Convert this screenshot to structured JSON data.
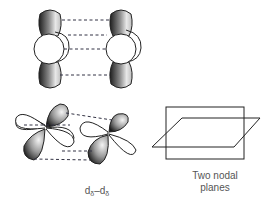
{
  "figure": {
    "top_panel": {
      "description": "Two dz2-like orbitals overlapping face to face",
      "dashed_connectors": 4
    },
    "bottom_left_panel": {
      "description": "Two four-lobed d orbitals (delta overlap)",
      "label_main": "d",
      "label_sub": "δ",
      "label_dash": "–",
      "label_main2": "d",
      "label_sub2": "δ"
    },
    "bottom_right_panel": {
      "description": "Two intersecting nodal planes",
      "caption_line1": "Two nodal",
      "caption_line2": "planes"
    }
  },
  "colors": {
    "lobe_dark": "#2a2a2a",
    "lobe_light": "#f2f2f2",
    "outline": "#222222",
    "dash": "#334",
    "text": "#555555"
  }
}
